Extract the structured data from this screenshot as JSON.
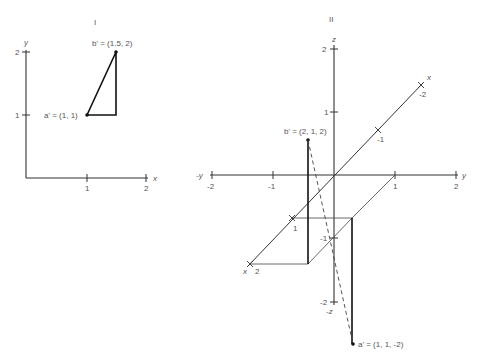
{
  "figure_left": {
    "title": "I",
    "axis_x_label": "x",
    "axis_y_label": "y",
    "x_ticks": [
      "1",
      "2"
    ],
    "y_ticks": [
      "1",
      "2"
    ],
    "point_a": "a' = (1, 1)",
    "point_b": "b' = (1.5, 2)"
  },
  "figure_right": {
    "title": "II",
    "axis_z_label": "z",
    "axis_neg_z_label": "-z",
    "axis_y_label": "y",
    "axis_neg_y_label": "-y",
    "axis_x_label": "x",
    "z_ticks": [
      "2",
      "1",
      "-1",
      "-2"
    ],
    "y_ticks": [
      "-2",
      "-1",
      "1",
      "2"
    ],
    "x_ticks": [
      "-2",
      "-1",
      "1",
      "2"
    ],
    "point_a": "a' = (1, 1, -2)",
    "point_b": "b' = (2, 1, 2)"
  },
  "colors": {
    "line": "#222222",
    "text": "#555555"
  }
}
